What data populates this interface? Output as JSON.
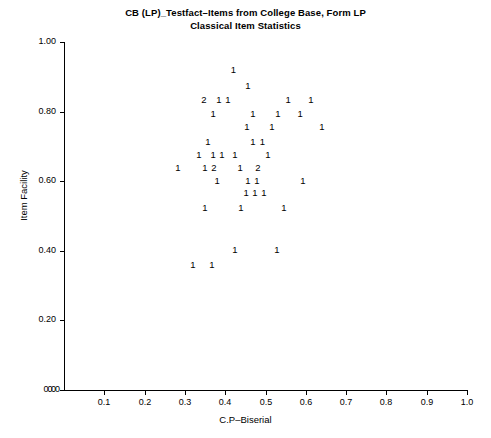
{
  "title": {
    "line1": "CB (LP)_Testfact–Items from College Base, Form LP",
    "line2": "Classical Item Statistics"
  },
  "axes": {
    "x_title": "C.P–Biserial",
    "y_title": "Item Facility",
    "x_ticks": [
      "0.0",
      "0.1",
      "0.2",
      "0.3",
      "0.4",
      "0.5",
      "0.6",
      "0.7",
      "0.8",
      "0.9",
      "1.0"
    ],
    "x_tick_values": [
      0.0,
      0.1,
      0.2,
      0.3,
      0.4,
      0.5,
      0.6,
      0.7,
      0.8,
      0.9,
      1.0
    ],
    "y_ticks": [
      "0.0",
      "0.20",
      "0.40",
      "0.60",
      "0.80",
      "1.00"
    ],
    "y_tick_values": [
      0.0,
      0.2,
      0.4,
      0.6,
      0.8,
      1.0
    ]
  },
  "chart_data": {
    "type": "scatter",
    "title": "CB (LP)_Testfact–Items from College Base, Form LP Classical Item Statistics",
    "xlabel": "C.P–Biserial",
    "ylabel": "Item Facility",
    "xlim": [
      0.0,
      1.0
    ],
    "ylim": [
      0.0,
      1.0
    ],
    "grid": false,
    "legend": null,
    "marker_style": "digit-count-label",
    "note": "Each plotted glyph is a digit giving the number of overlapping items at that location.",
    "points": [
      {
        "x": 0.42,
        "y": 0.919,
        "label": "1",
        "count": 1
      },
      {
        "x": 0.456,
        "y": 0.873,
        "label": "1",
        "count": 1
      },
      {
        "x": 0.347,
        "y": 0.833,
        "label": "2",
        "count": 2
      },
      {
        "x": 0.384,
        "y": 0.833,
        "label": "1",
        "count": 1
      },
      {
        "x": 0.407,
        "y": 0.833,
        "label": "1",
        "count": 1
      },
      {
        "x": 0.556,
        "y": 0.833,
        "label": "1",
        "count": 1
      },
      {
        "x": 0.613,
        "y": 0.833,
        "label": "1",
        "count": 1
      },
      {
        "x": 0.37,
        "y": 0.793,
        "label": "1",
        "count": 1
      },
      {
        "x": 0.469,
        "y": 0.793,
        "label": "1",
        "count": 1
      },
      {
        "x": 0.531,
        "y": 0.793,
        "label": "1",
        "count": 1
      },
      {
        "x": 0.586,
        "y": 0.793,
        "label": "1",
        "count": 1
      },
      {
        "x": 0.454,
        "y": 0.756,
        "label": "1",
        "count": 1
      },
      {
        "x": 0.516,
        "y": 0.756,
        "label": "1",
        "count": 1
      },
      {
        "x": 0.64,
        "y": 0.756,
        "label": "1",
        "count": 1
      },
      {
        "x": 0.357,
        "y": 0.713,
        "label": "1",
        "count": 1
      },
      {
        "x": 0.469,
        "y": 0.713,
        "label": "1",
        "count": 1
      },
      {
        "x": 0.492,
        "y": 0.713,
        "label": "1",
        "count": 1
      },
      {
        "x": 0.335,
        "y": 0.676,
        "label": "1",
        "count": 1
      },
      {
        "x": 0.37,
        "y": 0.676,
        "label": "1",
        "count": 1
      },
      {
        "x": 0.392,
        "y": 0.676,
        "label": "1",
        "count": 1
      },
      {
        "x": 0.424,
        "y": 0.676,
        "label": "1",
        "count": 1
      },
      {
        "x": 0.506,
        "y": 0.676,
        "label": "1",
        "count": 1
      },
      {
        "x": 0.283,
        "y": 0.639,
        "label": "1",
        "count": 1
      },
      {
        "x": 0.35,
        "y": 0.639,
        "label": "1",
        "count": 1
      },
      {
        "x": 0.372,
        "y": 0.639,
        "label": "2",
        "count": 2
      },
      {
        "x": 0.437,
        "y": 0.639,
        "label": "1",
        "count": 1
      },
      {
        "x": 0.481,
        "y": 0.639,
        "label": "2",
        "count": 2
      },
      {
        "x": 0.38,
        "y": 0.602,
        "label": "1",
        "count": 1
      },
      {
        "x": 0.456,
        "y": 0.602,
        "label": "1",
        "count": 1
      },
      {
        "x": 0.479,
        "y": 0.602,
        "label": "1",
        "count": 1
      },
      {
        "x": 0.593,
        "y": 0.602,
        "label": "1",
        "count": 1
      },
      {
        "x": 0.452,
        "y": 0.565,
        "label": "1",
        "count": 1
      },
      {
        "x": 0.474,
        "y": 0.565,
        "label": "1",
        "count": 1
      },
      {
        "x": 0.496,
        "y": 0.565,
        "label": "1",
        "count": 1
      },
      {
        "x": 0.35,
        "y": 0.523,
        "label": "1",
        "count": 1
      },
      {
        "x": 0.439,
        "y": 0.523,
        "label": "1",
        "count": 1
      },
      {
        "x": 0.546,
        "y": 0.523,
        "label": "1",
        "count": 1
      },
      {
        "x": 0.424,
        "y": 0.402,
        "label": "1",
        "count": 1
      },
      {
        "x": 0.528,
        "y": 0.402,
        "label": "1",
        "count": 1
      },
      {
        "x": 0.32,
        "y": 0.359,
        "label": "1",
        "count": 1
      },
      {
        "x": 0.367,
        "y": 0.359,
        "label": "1",
        "count": 1
      }
    ]
  }
}
